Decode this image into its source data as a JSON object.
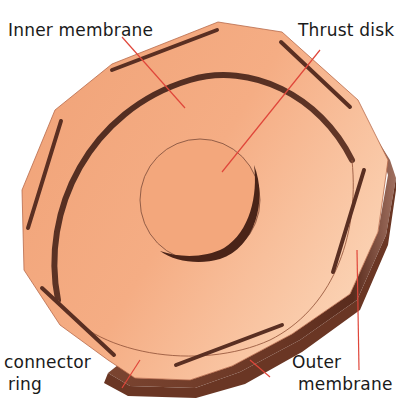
{
  "diagram": {
    "colors": {
      "face": "#f3a77c",
      "face_light": "#f8c6a4",
      "side_wall": "#6b3a28",
      "slot": "#5a2f22",
      "leader_line": "#e0463a",
      "label_text": "#1a1a1a"
    },
    "labels": [
      {
        "id": "inner-membrane",
        "text": "Inner membrane",
        "line": "Inner membrane"
      },
      {
        "id": "thrust-disk",
        "text": "Thrust disk",
        "line": "Thrust disk"
      },
      {
        "id": "connector-ring",
        "text": "connector ring",
        "line1": "connector",
        "line2": "ring"
      },
      {
        "id": "outer-membrane",
        "text": "Outer membrane",
        "line1": "Outer",
        "line2": "membrane"
      }
    ]
  }
}
